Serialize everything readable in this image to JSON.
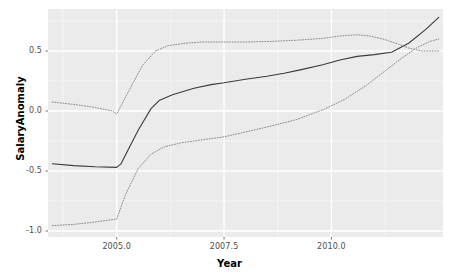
{
  "chart_data": {
    "type": "line",
    "title": "",
    "xlabel": "Year",
    "ylabel": "SalaryAnomaly",
    "xlim": [
      2003.4,
      2012.6
    ],
    "ylim": [
      -1.05,
      0.85
    ],
    "xticks": [
      2005.0,
      2007.5,
      2010.0
    ],
    "xticklabels": [
      "2005.0",
      "2007.5",
      "2010.0"
    ],
    "yticks": [
      0.5,
      0.0,
      -0.5,
      -1.0
    ],
    "yticklabels": [
      "0.5",
      "0.0",
      "-0.5",
      "-1.0"
    ],
    "grid": true,
    "grid_major_color": "#ffffff",
    "grid_minor_color": "#f5f5f5",
    "panel_background": "#ebebeb",
    "legend": "none",
    "series": [
      {
        "name": "fit",
        "style": "solid",
        "color": "#3b3b3b",
        "linewidth": 1.1,
        "x": [
          2003.5,
          2004.0,
          2004.5,
          2005.0,
          2005.1,
          2005.5,
          2005.8,
          2006.0,
          2006.3,
          2006.8,
          2007.2,
          2007.5,
          2008.0,
          2008.5,
          2008.9,
          2009.3,
          2009.8,
          2010.2,
          2010.6,
          2011.0,
          2011.4,
          2011.8,
          2012.2,
          2012.5
        ],
        "y": [
          -0.44,
          -0.455,
          -0.465,
          -0.47,
          -0.44,
          -0.16,
          0.02,
          0.09,
          0.135,
          0.19,
          0.22,
          0.235,
          0.265,
          0.29,
          0.315,
          0.345,
          0.385,
          0.425,
          0.455,
          0.47,
          0.49,
          0.565,
          0.68,
          0.78
        ]
      },
      {
        "name": "upper-confidence",
        "style": "dotted",
        "color": "#8c8c8c",
        "linewidth": 1.0,
        "x": [
          2003.5,
          2004.0,
          2004.5,
          2004.9,
          2005.0,
          2005.3,
          2005.6,
          2005.9,
          2006.2,
          2006.6,
          2007.0,
          2007.5,
          2008.0,
          2008.6,
          2009.2,
          2009.8,
          2010.2,
          2010.6,
          2010.9,
          2011.2,
          2011.5,
          2011.8,
          2012.1,
          2012.5
        ],
        "y": [
          0.075,
          0.055,
          0.03,
          0.0,
          -0.025,
          0.18,
          0.38,
          0.5,
          0.545,
          0.565,
          0.575,
          0.575,
          0.575,
          0.58,
          0.59,
          0.605,
          0.625,
          0.635,
          0.625,
          0.6,
          0.565,
          0.525,
          0.5,
          0.5
        ]
      },
      {
        "name": "lower-confidence",
        "style": "dotted",
        "color": "#8c8c8c",
        "linewidth": 1.0,
        "x": [
          2003.5,
          2004.0,
          2004.5,
          2004.9,
          2005.0,
          2005.2,
          2005.5,
          2005.8,
          2006.1,
          2006.5,
          2007.0,
          2007.5,
          2008.0,
          2008.6,
          2009.2,
          2009.8,
          2010.3,
          2010.8,
          2011.2,
          2011.6,
          2012.0,
          2012.3,
          2012.5
        ],
        "y": [
          -0.955,
          -0.945,
          -0.925,
          -0.905,
          -0.9,
          -0.7,
          -0.48,
          -0.36,
          -0.3,
          -0.265,
          -0.24,
          -0.215,
          -0.175,
          -0.125,
          -0.07,
          0.01,
          0.095,
          0.21,
          0.32,
          0.43,
          0.53,
          0.58,
          0.6
        ]
      }
    ]
  },
  "axis": {
    "y_title": "SalaryAnomaly",
    "x_title": "Year"
  }
}
